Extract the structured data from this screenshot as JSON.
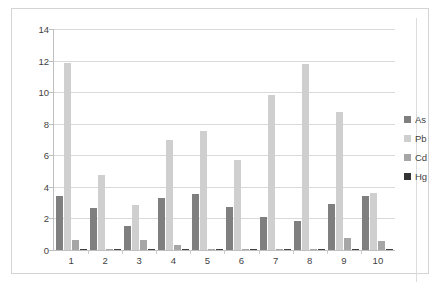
{
  "chart_data": {
    "type": "bar",
    "title": "",
    "subtitle": "",
    "xlabel": "",
    "ylabel": "",
    "ylim": [
      0,
      14
    ],
    "yticks": [
      0,
      2,
      4,
      6,
      8,
      10,
      12,
      14
    ],
    "grid": true,
    "legend_position": "right",
    "categories": [
      "1",
      "2",
      "3",
      "4",
      "5",
      "6",
      "7",
      "8",
      "9",
      "10"
    ],
    "series": [
      {
        "name": "As",
        "color": "#7f7f7f",
        "values": [
          3.45,
          2.65,
          1.5,
          3.3,
          3.55,
          2.7,
          2.1,
          1.85,
          2.9,
          3.45
        ]
      },
      {
        "name": "Pb",
        "color": "#cfcfcf",
        "values": [
          11.85,
          4.75,
          2.85,
          6.95,
          7.55,
          5.7,
          9.85,
          11.8,
          8.75,
          3.6
        ]
      },
      {
        "name": "Cd",
        "color": "#a6a6a6",
        "values": [
          0.65,
          0.05,
          0.65,
          0.3,
          0.05,
          0.05,
          0.05,
          0.05,
          0.75,
          0.55
        ]
      },
      {
        "name": "Hg",
        "color": "#404040",
        "values": [
          0.06,
          0.08,
          0.08,
          0.08,
          0.05,
          0.07,
          0.06,
          0.09,
          0.05,
          0.04
        ]
      }
    ]
  },
  "legend": {
    "items": [
      {
        "label": "As",
        "swatch": "legend-swatch-as"
      },
      {
        "label": "Pb",
        "swatch": "legend-swatch-pb"
      },
      {
        "label": "Cd",
        "swatch": "legend-swatch-cd"
      },
      {
        "label": "Hg",
        "swatch": "legend-swatch-hg"
      }
    ]
  },
  "axis": {
    "y_tick_labels": [
      "14",
      "12",
      "10",
      "8",
      "6",
      "4",
      "2",
      "0"
    ],
    "x_tick_labels": [
      "1",
      "2",
      "3",
      "4",
      "5",
      "6",
      "7",
      "8",
      "9",
      "10"
    ]
  }
}
